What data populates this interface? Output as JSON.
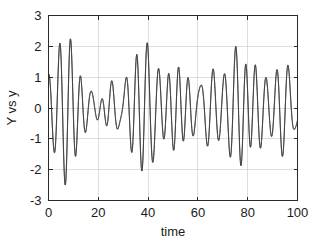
{
  "figure": {
    "background_color": "#ffffff",
    "axes_color": "#2b2b2b",
    "grid_color": "#c8c8c8"
  },
  "chart_data": {
    "type": "line",
    "title": "",
    "subtitle": "",
    "xlabel": "time",
    "ylabel": "Y vs y",
    "xlim": [
      0,
      100
    ],
    "ylim": [
      -3,
      3
    ],
    "xticks": [
      0,
      20,
      40,
      60,
      80,
      100
    ],
    "xtick_labels": [
      "0",
      "20",
      "40",
      "60",
      "80",
      "100"
    ],
    "yticks": [
      -3,
      -2,
      -1,
      0,
      1,
      2,
      3
    ],
    "ytick_labels": [
      "-3",
      "-2",
      "-1",
      "0",
      "1",
      "2",
      "3"
    ],
    "grid": true,
    "legend": "none",
    "box": true,
    "series": [
      {
        "name": "Y",
        "color": "#3c3c3c",
        "linewidth": 0.85,
        "model": {
          "kind": "sum-of-sinusoids",
          "components": [
            {
              "amplitude": 1.0,
              "frequency": 1.0,
              "phase": 1.55
            },
            {
              "amplitude": 0.62,
              "frequency": 1.12,
              "phase": 0.35
            },
            {
              "amplitude": 0.45,
              "frequency": 0.86,
              "phase": 2.4
            },
            {
              "amplitude": 0.3,
              "frequency": 1.31,
              "phase": 4.1
            },
            {
              "amplitude": 0.22,
              "frequency": 0.61,
              "phase": 5.2
            }
          ],
          "omega_scale": 1.43,
          "samples": 2400
        }
      },
      {
        "name": "y",
        "color": "#3c3c3c",
        "linewidth": 0.85,
        "model": {
          "kind": "sum-of-sinusoids",
          "components": [
            {
              "amplitude": 1.0,
              "frequency": 1.0,
              "phase": 1.62
            },
            {
              "amplitude": 0.62,
              "frequency": 1.12,
              "phase": 0.42
            },
            {
              "amplitude": 0.45,
              "frequency": 0.86,
              "phase": 2.47
            },
            {
              "amplitude": 0.3,
              "frequency": 1.31,
              "phase": 4.17
            },
            {
              "amplitude": 0.22,
              "frequency": 0.61,
              "phase": 5.27
            }
          ],
          "omega_scale": 1.43,
          "samples": 2400
        }
      }
    ],
    "observed_extrema": {
      "max_value": 2.45,
      "min_value": -2.48,
      "start_value": 2.2,
      "end_value": 2.1
    }
  }
}
